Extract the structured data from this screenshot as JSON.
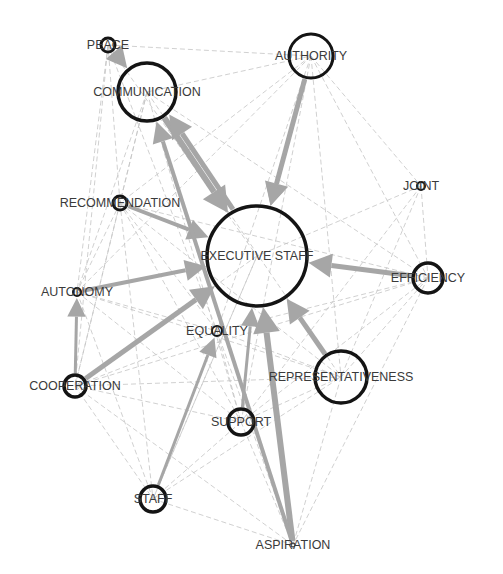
{
  "diagram": {
    "type": "directed-network",
    "colors": {
      "background": "#ffffff",
      "edge_thin": "#c4c4c4",
      "edge_thick": "#a6a6a6",
      "node_stroke": "#141414",
      "label": "#3a3a3a"
    },
    "nodes": [
      {
        "id": "peace",
        "label": "PEACE",
        "x": 108,
        "y": 45,
        "r": 7,
        "sw": 3
      },
      {
        "id": "communication",
        "label": "COMMUNICATION",
        "x": 147,
        "y": 92,
        "r": 29,
        "sw": 3.5
      },
      {
        "id": "authority",
        "label": "AUTHORITY",
        "x": 311,
        "y": 56,
        "r": 22,
        "sw": 3
      },
      {
        "id": "joint",
        "label": "JOINT",
        "x": 421,
        "y": 186,
        "r": 4,
        "sw": 2
      },
      {
        "id": "recommendation",
        "label": "RECOMMENDATION",
        "x": 120,
        "y": 203,
        "r": 7,
        "sw": 3
      },
      {
        "id": "executive_staff",
        "label": "EXECUTIVE STAFF",
        "x": 257,
        "y": 256,
        "r": 50,
        "sw": 3.5
      },
      {
        "id": "efficiency",
        "label": "EFFICIENCY",
        "x": 428,
        "y": 278,
        "r": 15,
        "sw": 3.5
      },
      {
        "id": "autonomy",
        "label": "AUTONOMY",
        "x": 77,
        "y": 292,
        "r": 4,
        "sw": 2
      },
      {
        "id": "equality",
        "label": "EQUALITY",
        "x": 217,
        "y": 331,
        "r": 5,
        "sw": 2
      },
      {
        "id": "representativeness",
        "label": "REPRESENTATIVENESS",
        "x": 341,
        "y": 377,
        "r": 26,
        "sw": 3.5
      },
      {
        "id": "cooperation",
        "label": "COOPERATION",
        "x": 75,
        "y": 386,
        "r": 11,
        "sw": 3.5
      },
      {
        "id": "support",
        "label": "SUPPORT",
        "x": 241,
        "y": 422,
        "r": 13,
        "sw": 3.5
      },
      {
        "id": "staff",
        "label": "STAFF",
        "x": 153,
        "y": 499,
        "r": 13,
        "sw": 3.5
      },
      {
        "id": "aspiration",
        "label": "ASPIRATION",
        "x": 293,
        "y": 545,
        "r": 2,
        "sw": 1
      }
    ],
    "thick_edges": [
      {
        "from": "communication",
        "to": "executive_staff",
        "w": 6
      },
      {
        "from": "executive_staff",
        "to": "communication",
        "w": 5
      },
      {
        "from": "authority",
        "to": "executive_staff",
        "w": 5
      },
      {
        "from": "recommendation",
        "to": "executive_staff",
        "w": 4
      },
      {
        "from": "autonomy",
        "to": "executive_staff",
        "w": 4
      },
      {
        "from": "cooperation",
        "to": "executive_staff",
        "w": 5
      },
      {
        "from": "cooperation",
        "to": "autonomy",
        "w": 3
      },
      {
        "from": "efficiency",
        "to": "executive_staff",
        "w": 5
      },
      {
        "from": "aspiration",
        "to": "executive_staff",
        "w": 6
      },
      {
        "from": "aspiration",
        "to": "communication",
        "w": 4
      },
      {
        "from": "representativeness",
        "to": "executive_staff",
        "w": 5
      },
      {
        "from": "support",
        "to": "executive_staff",
        "w": 3
      },
      {
        "from": "staff",
        "to": "equality",
        "w": 3
      },
      {
        "from": "peace",
        "to": "communication",
        "w": 4
      },
      {
        "from": "authority",
        "to": "executive_staff",
        "w": 3
      }
    ],
    "thin_edges": [
      [
        "peace",
        "authority"
      ],
      [
        "peace",
        "recommendation"
      ],
      [
        "peace",
        "autonomy"
      ],
      [
        "peace",
        "cooperation"
      ],
      [
        "peace",
        "executive_staff"
      ],
      [
        "peace",
        "equality"
      ],
      [
        "communication",
        "authority"
      ],
      [
        "communication",
        "recommendation"
      ],
      [
        "communication",
        "autonomy"
      ],
      [
        "communication",
        "cooperation"
      ],
      [
        "communication",
        "representativeness"
      ],
      [
        "communication",
        "support"
      ],
      [
        "communication",
        "efficiency"
      ],
      [
        "authority",
        "recommendation"
      ],
      [
        "authority",
        "joint"
      ],
      [
        "authority",
        "efficiency"
      ],
      [
        "authority",
        "representativeness"
      ],
      [
        "authority",
        "equality"
      ],
      [
        "authority",
        "support"
      ],
      [
        "authority",
        "autonomy"
      ],
      [
        "joint",
        "efficiency"
      ],
      [
        "joint",
        "executive_staff"
      ],
      [
        "joint",
        "representativeness"
      ],
      [
        "joint",
        "support"
      ],
      [
        "recommendation",
        "autonomy"
      ],
      [
        "recommendation",
        "cooperation"
      ],
      [
        "recommendation",
        "equality"
      ],
      [
        "recommendation",
        "support"
      ],
      [
        "recommendation",
        "staff"
      ],
      [
        "recommendation",
        "representativeness"
      ],
      [
        "autonomy",
        "equality"
      ],
      [
        "autonomy",
        "support"
      ],
      [
        "autonomy",
        "representativeness"
      ],
      [
        "autonomy",
        "staff"
      ],
      [
        "efficiency",
        "representativeness"
      ],
      [
        "efficiency",
        "support"
      ],
      [
        "efficiency",
        "cooperation"
      ],
      [
        "efficiency",
        "equality"
      ],
      [
        "efficiency",
        "aspiration"
      ],
      [
        "efficiency",
        "recommendation"
      ],
      [
        "equality",
        "cooperation"
      ],
      [
        "equality",
        "support"
      ],
      [
        "equality",
        "representativeness"
      ],
      [
        "equality",
        "aspiration"
      ],
      [
        "cooperation",
        "support"
      ],
      [
        "cooperation",
        "staff"
      ],
      [
        "cooperation",
        "representativeness"
      ],
      [
        "cooperation",
        "aspiration"
      ],
      [
        "support",
        "staff"
      ],
      [
        "support",
        "aspiration"
      ],
      [
        "support",
        "representativeness"
      ],
      [
        "staff",
        "aspiration"
      ],
      [
        "staff",
        "representativeness"
      ],
      [
        "staff",
        "executive_staff"
      ],
      [
        "representativeness",
        "aspiration"
      ],
      [
        "executive_staff",
        "staff"
      ],
      [
        "executive_staff",
        "cooperation"
      ]
    ]
  }
}
